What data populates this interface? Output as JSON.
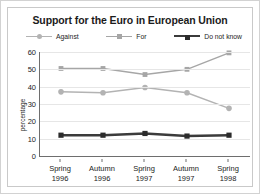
{
  "chart_data": {
    "type": "line",
    "title": "Support for the Euro in European Union",
    "xlabel": "",
    "ylabel": "percentage",
    "categories": [
      "Spring 1996",
      "Autumn 1996",
      "Spring 1997",
      "Autumn 1997",
      "Spring 1998"
    ],
    "category_lines": [
      {
        "line1": "Spring",
        "line2": "1996"
      },
      {
        "line1": "Autumn",
        "line2": "1996"
      },
      {
        "line1": "Spring",
        "line2": "1997"
      },
      {
        "line1": "Autumn",
        "line2": "1997"
      },
      {
        "line1": "Spring",
        "line2": "1998"
      }
    ],
    "series": [
      {
        "name": "Against",
        "values": [
          37,
          36.5,
          39.5,
          36.5,
          27.5
        ],
        "color": "#b3b3b3",
        "marker": "circle",
        "line_width": 1.5
      },
      {
        "name": "For",
        "values": [
          50.5,
          50.5,
          47,
          50,
          59.5
        ],
        "color": "#a6a6a6",
        "marker": "square",
        "line_width": 1.5
      },
      {
        "name": "Do not know",
        "values": [
          12,
          12,
          13,
          11.5,
          12
        ],
        "color": "#3b3b3b",
        "marker": "square",
        "line_width": 2.5
      }
    ],
    "ylim": [
      0,
      60
    ],
    "yticks": [
      0,
      10,
      20,
      30,
      40,
      50,
      60
    ],
    "ytick_labels": [
      "0",
      "10",
      "20",
      "30",
      "40",
      "50",
      "60"
    ],
    "grid": true,
    "grid_color": "#e6e6e6",
    "legend_position": "top",
    "axis_color": "#6e6e6e",
    "background": "#ffffff",
    "border_color": "#c9c9c9"
  }
}
